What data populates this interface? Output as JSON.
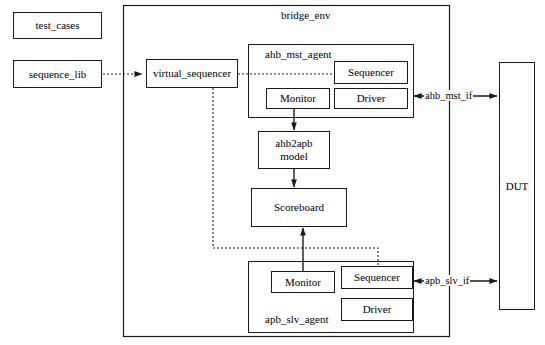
{
  "diagram": {
    "stroke_color": "#1a1a1a",
    "background_color": "#ffffff"
  },
  "external_blocks": {
    "test_cases": "test_cases",
    "sequence_lib": "sequence_lib",
    "dut": "DUT"
  },
  "env": {
    "title": "bridge_env",
    "virtual_sequencer": "virtual_sequencer",
    "ahb2apb_model_line1": "ahb2apb",
    "ahb2apb_model_line2": "model",
    "scoreboard": "Scoreboard"
  },
  "ahb_mst_agent": {
    "title": "ahb_mst_agent",
    "sequencer": "Sequencer",
    "monitor": "Monitor",
    "driver": "Driver"
  },
  "apb_slv_agent": {
    "title": "apb_slv_agent",
    "sequencer": "Sequencer",
    "monitor": "Monitor",
    "driver": "Driver"
  },
  "interfaces": {
    "ahb_mst_if": "ahb_mst_if",
    "apb_slv_if": "apb_slv_if"
  }
}
